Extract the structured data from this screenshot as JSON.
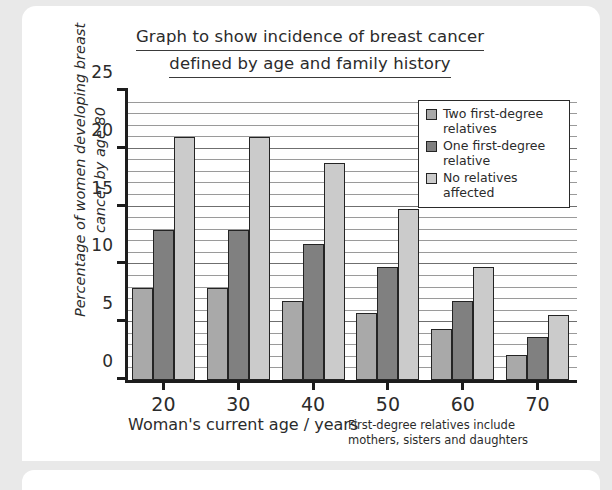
{
  "title": {
    "line1": "Graph to show incidence of breast cancer",
    "line2": "defined by age and family history"
  },
  "footnote": {
    "line1": "First-degree relatives include",
    "line2": "mothers, sisters and daughters"
  },
  "colors": {
    "two_relatives": "#a9a9a9",
    "one_relative": "#808080",
    "no_relatives": "#cbcbcb",
    "bar_outline": "#242424",
    "axis": "#1d1d1d",
    "gridline": "#9a9a9a",
    "card": "#ffffff",
    "page_background": "#e9e9e9",
    "text": "#2b2b2b"
  },
  "chart_data": {
    "type": "bar",
    "title": "Graph to show incidence of breast cancer defined by age and family history",
    "xlabel": "Woman's current age / years",
    "ylabel": "Percentage of women developing breast cancer by age 80",
    "categories": [
      "20",
      "30",
      "40",
      "50",
      "60",
      "70"
    ],
    "xtick_labels": [
      "20",
      "30",
      "40",
      "50",
      "60",
      "70"
    ],
    "ytick_labels": [
      "0",
      "5",
      "10",
      "15",
      "20",
      "25"
    ],
    "yticks": [
      0,
      5,
      10,
      15,
      20,
      25
    ],
    "ylim": [
      0,
      25
    ],
    "ymajor_step": 5,
    "yminor_step": 1,
    "grid": "horizontal",
    "legend_position": "upper right",
    "series": [
      {
        "name": "Two first-degree relatives",
        "color": "#a9a9a9",
        "values": [
          8.0,
          8.0,
          6.8,
          5.8,
          4.4,
          2.2
        ]
      },
      {
        "name": "One first-degree relative",
        "color": "#808080",
        "values": [
          13.0,
          13.0,
          11.8,
          9.8,
          6.8,
          3.7
        ]
      },
      {
        "name": "No relatives affected",
        "color": "#cbcbcb",
        "values": [
          21.0,
          21.0,
          18.8,
          14.8,
          9.8,
          5.6
        ]
      }
    ]
  },
  "legend": [
    {
      "label": "Two first-degree relatives",
      "color": "#a9a9a9"
    },
    {
      "label": "One first-degree relative",
      "color": "#808080"
    },
    {
      "label": "No relatives affected",
      "color": "#cbcbcb"
    }
  ]
}
